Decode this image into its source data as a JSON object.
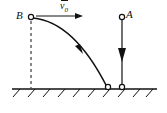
{
  "figure": {
    "stroke_color": "#111111",
    "background_color": "#ffffff",
    "labels": {
      "point_b": "B",
      "point_a": "A",
      "velocity": "v",
      "velocity_subscript": "0"
    },
    "points": {
      "b": {
        "x": 31,
        "y": 17
      },
      "a": {
        "x": 122,
        "y": 18
      },
      "curve_landing": {
        "x": 108,
        "y": 88
      },
      "a_landing": {
        "x": 122,
        "y": 88
      }
    },
    "ground": {
      "y": 89,
      "x_start": 12,
      "x_end": 157,
      "hatch_count": 10
    },
    "velocity_arrow": {
      "x_start": 36,
      "x_end": 83,
      "y": 16,
      "direction": "right"
    },
    "fall_arrow": {
      "x": 122,
      "y_start": 18,
      "y_end": 88,
      "marker_y": 55,
      "direction": "down"
    },
    "trajectory": {
      "shape": "parabola",
      "from": "B",
      "to": "ground",
      "direction_marker_t": 0.62
    },
    "dashed_drop_line": {
      "x": 31,
      "y_start": 20,
      "y_end": 89
    }
  }
}
